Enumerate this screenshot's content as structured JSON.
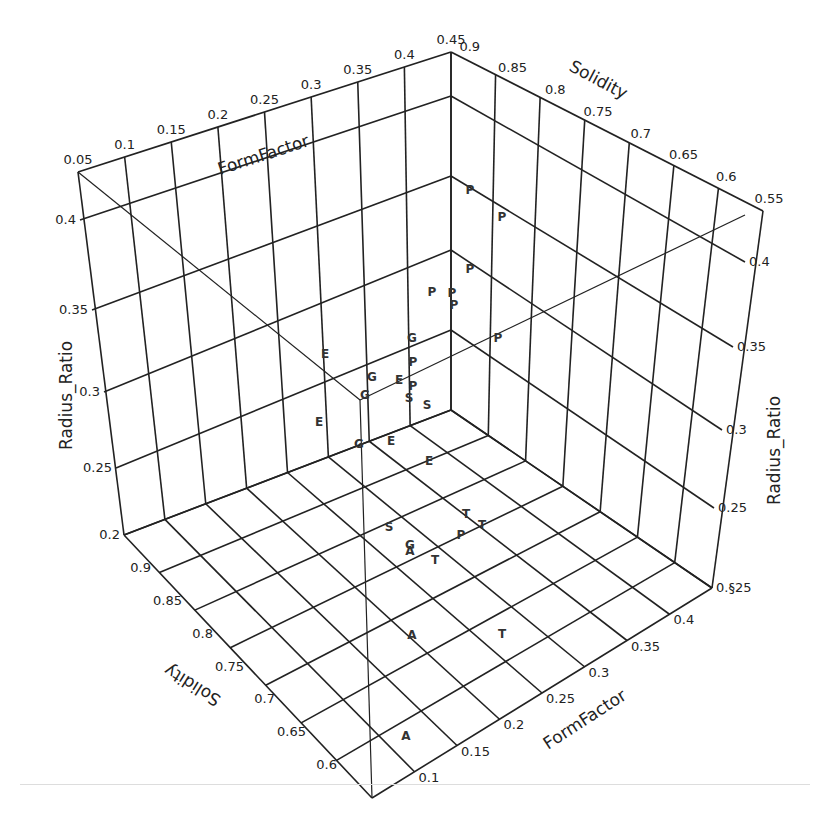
{
  "chart_data": {
    "type": "scatter",
    "subtype": "3d-scatter-text-markers",
    "title": "",
    "axes": {
      "x": {
        "label": "FormFactor",
        "range": [
          0.05,
          0.45
        ],
        "ticks": [
          "0.05",
          "0.1",
          "0.15",
          "0.2",
          "0.25",
          "0.3",
          "0.35",
          "0.4",
          "0.45"
        ]
      },
      "y": {
        "label": "Solidity",
        "range": [
          0.55,
          0.9
        ],
        "ticks": [
          "0.9",
          "0.85",
          "0.8",
          "0.75",
          "0.7",
          "0.65",
          "0.6",
          "0.55"
        ]
      },
      "z": {
        "label": "Radius_Ratio",
        "range": [
          0.2,
          0.4
        ],
        "ticks": [
          "0.2",
          "0.25",
          "0.3",
          "0.35",
          "0.4"
        ]
      }
    },
    "tick_labels": {
      "top_formfactor": [
        "0.05",
        "0.1",
        "0.15",
        "0.2",
        "0.25",
        "0.3",
        "0.35",
        "0.4",
        "0.45"
      ],
      "top_solidity": [
        "0.9",
        "0.85",
        "0.8",
        "0.75",
        "0.7",
        "0.65",
        "0.6",
        "0.55"
      ],
      "left_radius": [
        "0.4",
        "0.35",
        "0.3",
        "0.25",
        "0.2"
      ],
      "right_radius": [
        "0.4",
        "0.35",
        "0.3",
        "0.25",
        "0.§25"
      ],
      "bottom_solidity": [
        "0.9",
        "0.85",
        "0.8",
        "0.75",
        "0.7",
        "0.65",
        "0.6"
      ],
      "bottom_formfactor": [
        "0.1",
        "0.15",
        "0.2",
        "0.25",
        "0.3",
        "0.35",
        "0.4"
      ]
    },
    "axis_labels": {
      "top_left": "FormFactor",
      "top_right": "Solidity",
      "left": "Radius_Ratio",
      "right": "Radius_Ratio",
      "bottom_left": "Solidity",
      "bottom_right": "FormFactor"
    },
    "grid": true,
    "legend": null,
    "marker_classes": [
      "P",
      "E",
      "G",
      "S",
      "T",
      "A"
    ],
    "points_screen": [
      {
        "label": "P",
        "x": 470,
        "y": 190
      },
      {
        "label": "P",
        "x": 502,
        "y": 217
      },
      {
        "label": "P",
        "x": 470,
        "y": 269
      },
      {
        "label": "P",
        "x": 432,
        "y": 292
      },
      {
        "label": "P",
        "x": 452,
        "y": 293
      },
      {
        "label": "P",
        "x": 454,
        "y": 305
      },
      {
        "label": "P",
        "x": 498,
        "y": 338
      },
      {
        "label": "G",
        "x": 412,
        "y": 338
      },
      {
        "label": "E",
        "x": 325,
        "y": 354
      },
      {
        "label": "P",
        "x": 413,
        "y": 362
      },
      {
        "label": "G",
        "x": 372,
        "y": 377
      },
      {
        "label": "E",
        "x": 399,
        "y": 380
      },
      {
        "label": "P",
        "x": 413,
        "y": 386
      },
      {
        "label": "G",
        "x": 365,
        "y": 395
      },
      {
        "label": "S",
        "x": 409,
        "y": 398
      },
      {
        "label": "S",
        "x": 427,
        "y": 405
      },
      {
        "label": "E",
        "x": 319,
        "y": 422
      },
      {
        "label": "G",
        "x": 359,
        "y": 444
      },
      {
        "label": "E",
        "x": 391,
        "y": 441
      },
      {
        "label": "E",
        "x": 429,
        "y": 461
      },
      {
        "label": "T",
        "x": 466,
        "y": 514
      },
      {
        "label": "S",
        "x": 389,
        "y": 527
      },
      {
        "label": "T",
        "x": 482,
        "y": 525
      },
      {
        "label": "P",
        "x": 461,
        "y": 535
      },
      {
        "label": "G",
        "x": 410,
        "y": 545
      },
      {
        "label": "A",
        "x": 410,
        "y": 551
      },
      {
        "label": "T",
        "x": 435,
        "y": 560
      },
      {
        "label": "A",
        "x": 412,
        "y": 635
      },
      {
        "label": "T",
        "x": 502,
        "y": 634
      },
      {
        "label": "A",
        "x": 406,
        "y": 736
      }
    ]
  }
}
